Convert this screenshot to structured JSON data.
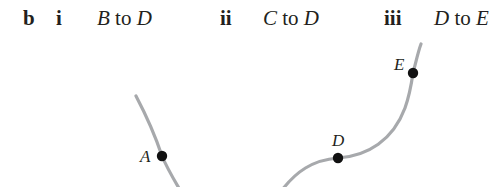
{
  "question": {
    "part": "b",
    "subparts": [
      {
        "numeral": "i",
        "from": "B",
        "connector": "to",
        "to": "D"
      },
      {
        "numeral": "ii",
        "from": "C",
        "connector": "to",
        "to": "D"
      },
      {
        "numeral": "iii",
        "from": "D",
        "connector": "to",
        "to": "E"
      }
    ]
  },
  "diagram": {
    "points": [
      {
        "label": "A"
      },
      {
        "label": "D"
      },
      {
        "label": "E"
      }
    ],
    "colors": {
      "curve": "#a7a9ac",
      "point": "#111111",
      "text": "#231f20"
    }
  }
}
